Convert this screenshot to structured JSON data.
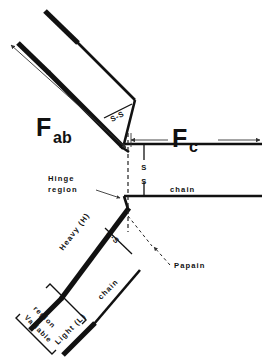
{
  "figure": {
    "background_color": "#ffffff",
    "ink_color": "#111111"
  },
  "labels": {
    "fab_main": "F",
    "fab_sub": "ab",
    "fc_main": "F",
    "fc_sub": "c",
    "hinge_line1": "Hinge",
    "hinge_line2": "region",
    "heavy_chain": "Heavy (H)",
    "heavy_chain_word": "chain",
    "light_chain": "Light (L)",
    "light_chain_word": "chain",
    "fc_chain_word": "chain",
    "papain": "Papain",
    "variable_line1": "Variable",
    "variable_line2": "region",
    "ss_interchain_upper": "S-S",
    "ss_interchain_lower": "S-S",
    "ss_hinge_top": "S",
    "ss_hinge_bottom": "S",
    "ss_hinge_middle_dash": "-"
  },
  "annotations": {
    "fab_span_arrow": "double-headed-arrow-fab",
    "fc_span_arrow": "double-headed-arrow-fc",
    "hinge_pointer": "arrow-to-hinge",
    "papain_pointer": "arrow-to-papain-cleavage",
    "cleavage_marker": "dashed-vertical-papain-cut"
  }
}
